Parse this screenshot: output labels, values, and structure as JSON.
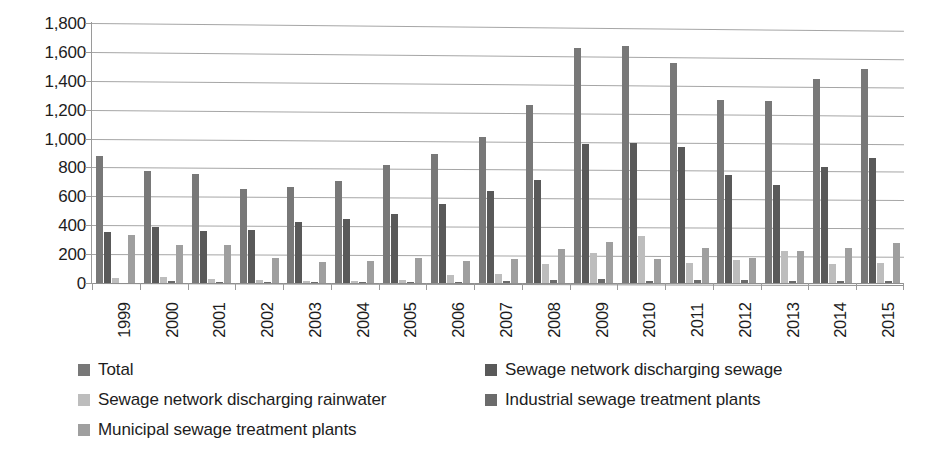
{
  "chart_data": {
    "type": "bar",
    "title": "",
    "subtitle": "",
    "xlabel": "",
    "ylabel": "",
    "ylim": [
      0,
      1800
    ],
    "y_tick_step": 200,
    "grid": true,
    "legend_position": "bottom",
    "categories": [
      "1999",
      "2000",
      "2001",
      "2002",
      "2003",
      "2004",
      "2005",
      "2006",
      "2007",
      "2008",
      "2009",
      "2010",
      "2011",
      "2012",
      "2013",
      "2014",
      "2015"
    ],
    "y_tick_labels": [
      "1,800",
      "1,600",
      "1,400",
      "1,200",
      "1,000",
      "800",
      "600",
      "400",
      "200",
      "0"
    ],
    "y_tick_values": [
      1800,
      1600,
      1400,
      1200,
      1000,
      800,
      600,
      400,
      200,
      0
    ],
    "series": [
      {
        "name": "Total",
        "color": "#787878",
        "values": [
          880,
          775,
          755,
          650,
          665,
          705,
          820,
          895,
          1010,
          1230,
          1625,
          1640,
          1525,
          1270,
          1260,
          1410,
          1485
        ]
      },
      {
        "name": "Sewage network discharging sewage",
        "color": "#595959",
        "values": [
          355,
          390,
          360,
          365,
          425,
          440,
          480,
          545,
          640,
          710,
          965,
          970,
          945,
          750,
          680,
          805,
          865
        ]
      },
      {
        "name": "Sewage network discharging rainwater",
        "color": "#bdbdbd",
        "values": [
          35,
          45,
          25,
          20,
          15,
          15,
          20,
          55,
          60,
          130,
          205,
          325,
          140,
          160,
          225,
          135,
          140
        ]
      },
      {
        "name": "Industrial sewage treatment plants",
        "color": "#6b6b6b",
        "values": [
          0,
          15,
          10,
          10,
          5,
          5,
          10,
          10,
          15,
          20,
          25,
          15,
          20,
          20,
          15,
          15,
          15
        ]
      },
      {
        "name": "Municipal sewage treatment plants",
        "color": "#9f9f9f",
        "values": [
          330,
          260,
          265,
          175,
          145,
          150,
          175,
          150,
          165,
          235,
          285,
          165,
          240,
          175,
          225,
          240,
          280
        ]
      }
    ]
  },
  "legend": {
    "items": [
      {
        "label": "Total",
        "swatch": "legend-swatch-total"
      },
      {
        "label": "Sewage network discharging sewage",
        "swatch": "legend-swatch-sewage-network-sewage"
      },
      {
        "label": "Sewage network discharging rainwater",
        "swatch": "legend-swatch-sewage-network-rainwater"
      },
      {
        "label": "Industrial sewage treatment plants",
        "swatch": "legend-swatch-industrial-plants"
      },
      {
        "label": "Municipal sewage treatment plants",
        "swatch": "legend-swatch-municipal-plants"
      }
    ]
  }
}
